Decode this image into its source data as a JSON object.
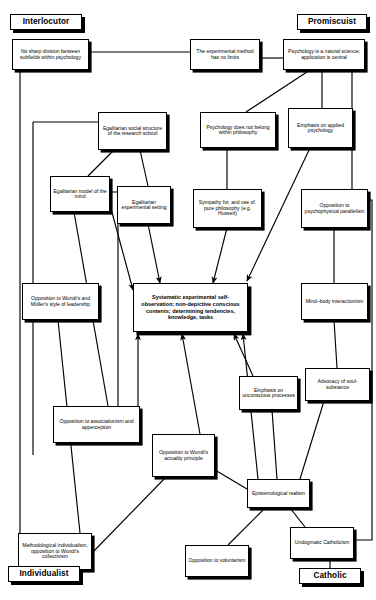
{
  "diagram": {
    "title": "",
    "width": 376,
    "height": 600,
    "style": {
      "box_fill": "#ffffff",
      "box_stroke": "#000000",
      "shadow": "#000000",
      "background": "#ffffff"
    },
    "roles": [
      {
        "id": "role_interlocutor",
        "label": "Interlocutor",
        "x": 10,
        "y": 14,
        "w": 72,
        "h": 16
      },
      {
        "id": "role_promiscuist",
        "label": "Promiscuist",
        "x": 297,
        "y": 14,
        "w": 70,
        "h": 16
      },
      {
        "id": "role_individualist",
        "label": "Individualist",
        "x": 8,
        "y": 566,
        "w": 72,
        "h": 16
      },
      {
        "id": "role_catholic",
        "label": "Catholic",
        "x": 299,
        "y": 568,
        "w": 62,
        "h": 16
      }
    ],
    "nodes": [
      {
        "id": "n_nosharp",
        "label": "No sharp division between subfields within psychology",
        "x": 12,
        "y": 39,
        "w": 77,
        "h": 31
      },
      {
        "id": "n_expmethod",
        "label": "The experimental method has no limits",
        "x": 190,
        "y": 39,
        "w": 70,
        "h": 31
      },
      {
        "id": "n_natsci",
        "label": "Psychology is a natural science; application is central",
        "x": 283,
        "y": 39,
        "w": 82,
        "h": 31
      },
      {
        "id": "n_egalsocial",
        "label": "Egalitarian social structure of the research school",
        "x": 98,
        "y": 112,
        "w": 69,
        "h": 38
      },
      {
        "id": "n_psychnotphil",
        "label": "Psychology does not belong within philosophy",
        "x": 200,
        "y": 112,
        "w": 76,
        "h": 36
      },
      {
        "id": "n_applied",
        "label": "Emphasis on applied psychology",
        "x": 288,
        "y": 108,
        "w": 65,
        "h": 40
      },
      {
        "id": "n_egalmodel",
        "label": "Egalitarian model of the mind",
        "x": 50,
        "y": 176,
        "w": 60,
        "h": 36
      },
      {
        "id": "n_egalexp",
        "label": "Egalitarian experimental setting",
        "x": 117,
        "y": 186,
        "w": 54,
        "h": 38
      },
      {
        "id": "n_sympathy",
        "label": "Sympathy for, and use of, pure philosophy (e.g. Husserl)",
        "x": 193,
        "y": 189,
        "w": 69,
        "h": 39
      },
      {
        "id": "n_psychophys",
        "label": "Opposition to psychophysical parallelism",
        "x": 301,
        "y": 189,
        "w": 67,
        "h": 39
      },
      {
        "id": "n_leadership",
        "label": "Opposition to Wundt's and Müller's style of leadership",
        "x": 22,
        "y": 283,
        "w": 77,
        "h": 37
      },
      {
        "id": "n_central",
        "label": "Systematic experimental self-observation; non-depictive conscious contents; determining tendencies, knowledge, tasks",
        "x": 133,
        "y": 283,
        "w": 115,
        "h": 49,
        "central": true
      },
      {
        "id": "n_mindbody",
        "label": "Mind–body interactionism",
        "x": 301,
        "y": 283,
        "w": 67,
        "h": 37
      },
      {
        "id": "n_soul",
        "label": "Advocacy of soul-substance",
        "x": 305,
        "y": 368,
        "w": 65,
        "h": 33
      },
      {
        "id": "n_unconscious",
        "label": "Emphasis on unconscious processes",
        "x": 239,
        "y": 376,
        "w": 59,
        "h": 34
      },
      {
        "id": "n_assoc",
        "label": "Opposition to associationism and apperception",
        "x": 53,
        "y": 406,
        "w": 87,
        "h": 37
      },
      {
        "id": "n_actuality",
        "label": "Opposition to Wundt's actuality principle",
        "x": 152,
        "y": 434,
        "w": 63,
        "h": 43
      },
      {
        "id": "n_epistem",
        "label": "Epistemological realism",
        "x": 247,
        "y": 479,
        "w": 63,
        "h": 29
      },
      {
        "id": "n_method",
        "label": "Methodological individualism, opposition to Wundt's collectivism",
        "x": 18,
        "y": 533,
        "w": 74,
        "h": 37
      },
      {
        "id": "n_voluntarism",
        "label": "Opposition to voluntarism",
        "x": 185,
        "y": 545,
        "w": 64,
        "h": 32
      },
      {
        "id": "n_undogmatic",
        "label": "Undogmatic Catholicism",
        "x": 290,
        "y": 527,
        "w": 64,
        "h": 32
      }
    ],
    "edges": [
      {
        "from": "n_nosharp",
        "to": "n_expmethod",
        "kind": "orthogonal",
        "arrow": false
      },
      {
        "from": "n_expmethod",
        "to": "n_natsci",
        "kind": "orthogonal",
        "arrow": false
      },
      {
        "from": "n_natsci",
        "to": "n_psychnotphil",
        "kind": "straight",
        "arrow": false
      },
      {
        "from": "n_natsci",
        "to": "n_applied",
        "kind": "straight",
        "arrow": false
      },
      {
        "from": "n_natsci",
        "to": "n_psychophys",
        "kind": "straight",
        "arrow": false
      },
      {
        "from": "n_nosharp",
        "to": "n_egalsocial",
        "kind": "orthogonal",
        "arrow": false
      },
      {
        "from": "n_nosharp",
        "to": "n_method",
        "kind": "orthogonal",
        "arrow": false
      },
      {
        "from": "n_egalsocial",
        "to": "n_egalmodel",
        "kind": "straight",
        "arrow": false
      },
      {
        "from": "n_egalsocial",
        "to": "n_egalexp",
        "kind": "straight",
        "arrow": false
      },
      {
        "from": "n_egalmodel",
        "to": "n_assoc",
        "kind": "straight",
        "arrow": false
      },
      {
        "from": "n_egalmodel",
        "to": "n_central",
        "kind": "straight",
        "arrow": true
      },
      {
        "from": "n_egalexp",
        "to": "n_central",
        "kind": "straight",
        "arrow": true
      },
      {
        "from": "n_psychnotphil",
        "to": "n_sympathy",
        "kind": "straight",
        "arrow": false
      },
      {
        "from": "n_sympathy",
        "to": "n_central",
        "kind": "straight",
        "arrow": true
      },
      {
        "from": "n_applied",
        "to": "n_central",
        "kind": "straight",
        "arrow": true
      },
      {
        "from": "n_psychophys",
        "to": "n_mindbody",
        "kind": "straight",
        "arrow": false
      },
      {
        "from": "n_mindbody",
        "to": "n_soul",
        "kind": "straight",
        "arrow": false
      },
      {
        "from": "n_leadership",
        "to": "n_method",
        "kind": "straight",
        "arrow": false
      },
      {
        "from": "n_assoc",
        "to": "n_central",
        "kind": "orthogonal",
        "arrow": true
      },
      {
        "from": "n_actuality",
        "to": "n_central",
        "kind": "straight",
        "arrow": true
      },
      {
        "from": "n_unconscious",
        "to": "n_central",
        "kind": "straight",
        "arrow": true
      },
      {
        "from": "n_unconscious",
        "to": "n_epistem",
        "kind": "straight",
        "arrow": false
      },
      {
        "from": "n_soul",
        "to": "n_epistem",
        "kind": "straight",
        "arrow": false
      },
      {
        "from": "n_epistem",
        "to": "n_central",
        "kind": "straight",
        "arrow": true
      },
      {
        "from": "n_epistem",
        "to": "n_actuality",
        "kind": "straight",
        "arrow": false
      },
      {
        "from": "n_epistem",
        "to": "n_voluntarism",
        "kind": "straight",
        "arrow": false
      },
      {
        "from": "n_epistem",
        "to": "n_undogmatic",
        "kind": "straight",
        "arrow": false
      },
      {
        "from": "n_actuality",
        "to": "n_method",
        "kind": "straight",
        "arrow": false
      },
      {
        "from": "n_undogmatic",
        "to": "role_catholic",
        "kind": "straight",
        "arrow": false
      },
      {
        "from": "n_method",
        "to": "role_individualist",
        "kind": "straight",
        "arrow": false
      }
    ],
    "edge_paths": [
      {
        "name": "nosharp-to-expmethod",
        "d": "M 89 52 L 190 52"
      },
      {
        "name": "expmethod-to-natsci",
        "d": "M 260 58 L 283 58"
      },
      {
        "name": "natsci-down-left-to-psychnotphil",
        "d": "M 310 70 L 246 112"
      },
      {
        "name": "natsci-down-to-applied",
        "d": "M 322 70 L 322 108"
      },
      {
        "name": "natsci-down-to-psychophys",
        "d": "M 352 70 L 352 189"
      },
      {
        "name": "nosharp-left-spine",
        "d": "M 20 70 L 20 545 L 38 545"
      },
      {
        "name": "nosharp-branch-to-egalsocial",
        "d": "M 33 122 L 98 122"
      },
      {
        "name": "nosharp-branch-down",
        "d": "M 33 122 L 33 455 L 33 455"
      },
      {
        "name": "egalsocial-to-egalmodel",
        "d": "M 114 150 L 88 176"
      },
      {
        "name": "egalsocial-to-egalexp",
        "d": "M 140 150 L 148 186"
      },
      {
        "name": "egalmodel-to-assoc",
        "d": "M 74 212 L 108 406"
      },
      {
        "name": "egalmodel-right-down",
        "d": "M 110 192 L 118 192 L 118 420 L 118 420"
      },
      {
        "name": "egalmodel-to-central",
        "d": "M 110 205 L 133 290",
        "arrow": true
      },
      {
        "name": "egalexp-to-central",
        "d": "M 148 224 L 160 283",
        "arrow": true
      },
      {
        "name": "psychnotphil-to-sympathy",
        "d": "M 227 148 L 227 189"
      },
      {
        "name": "sympathy-to-central",
        "d": "M 227 228 L 213 283",
        "arrow": true
      },
      {
        "name": "applied-to-central",
        "d": "M 310 148 L 247 281",
        "arrow": true
      },
      {
        "name": "psychophys-to-mindbody",
        "d": "M 334 228 L 334 283"
      },
      {
        "name": "mindbody-to-soul",
        "d": "M 334 320 L 337 368"
      },
      {
        "name": "leadership-to-method",
        "d": "M 58 320 L 80 533"
      },
      {
        "name": "assoc-to-central-vertical",
        "d": "M 138 443 L 138 334",
        "arrow": true
      },
      {
        "name": "actuality-to-central",
        "d": "M 200 434 L 182 334",
        "arrow": true
      },
      {
        "name": "unconscious-to-central",
        "d": "M 253 376 L 234 334",
        "arrow": true
      },
      {
        "name": "unconscious-to-epistem",
        "d": "M 272 410 L 277 479"
      },
      {
        "name": "soul-to-epistem",
        "d": "M 324 401 L 300 479"
      },
      {
        "name": "epistem-to-central",
        "d": "M 258 479 L 243 334",
        "arrow": true
      },
      {
        "name": "epistem-to-actuality",
        "d": "M 247 489 L 215 470"
      },
      {
        "name": "epistem-to-voluntarism",
        "d": "M 265 508 L 228 545"
      },
      {
        "name": "epistem-to-undogmatic",
        "d": "M 290 508 L 305 527"
      },
      {
        "name": "actuality-to-method",
        "d": "M 166 477 L 92 553"
      },
      {
        "name": "undogmatic-to-catholic",
        "d": "M 330 559 L 330 568"
      },
      {
        "name": "method-to-individualist",
        "d": "M 44 570 L 44 566"
      },
      {
        "name": "psychophys-right-spine",
        "d": "M 368 200 L 372 200 L 372 540 L 354 540"
      }
    ]
  }
}
